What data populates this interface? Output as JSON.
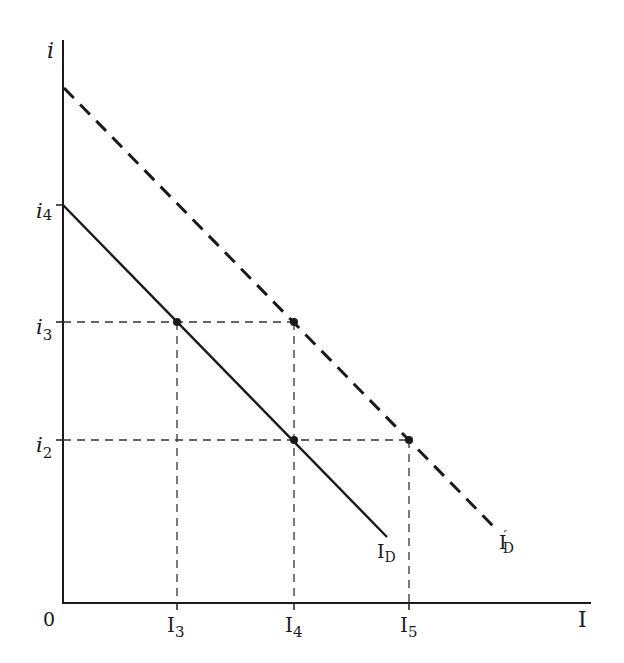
{
  "axes": {
    "y_label": "i",
    "x_label": "I",
    "origin_label": "0"
  },
  "y_ticks": [
    {
      "label": "i",
      "sub": "4",
      "y": 205
    },
    {
      "label": "i",
      "sub": "3",
      "y": 322
    },
    {
      "label": "i",
      "sub": "2",
      "y": 440
    }
  ],
  "x_ticks": [
    {
      "label": "I",
      "sub": "3",
      "x": 177
    },
    {
      "label": "I",
      "sub": "4",
      "x": 294
    },
    {
      "label": "I",
      "sub": "5",
      "x": 409
    }
  ],
  "curves": [
    {
      "name": "I",
      "sub": "D",
      "prime": "",
      "style": "solid",
      "from": [
        63,
        205
      ],
      "to": [
        387,
        537
      ]
    },
    {
      "name": "I",
      "sub": "D",
      "prime": "′",
      "style": "dashed",
      "from": [
        64,
        88
      ],
      "to": [
        497,
        530
      ]
    }
  ],
  "points": [
    {
      "x": 177,
      "y": 322,
      "on": "ID",
      "at": "i3,I3"
    },
    {
      "x": 294,
      "y": 322,
      "on": "I'D",
      "at": "i3,I4"
    },
    {
      "x": 294,
      "y": 440,
      "on": "ID",
      "at": "i2,I4"
    },
    {
      "x": 409,
      "y": 440,
      "on": "I'D",
      "at": "i2,I5"
    }
  ],
  "colors": {
    "ink": "#1a1a1a",
    "guide": "#333333",
    "background": "#ffffff"
  }
}
